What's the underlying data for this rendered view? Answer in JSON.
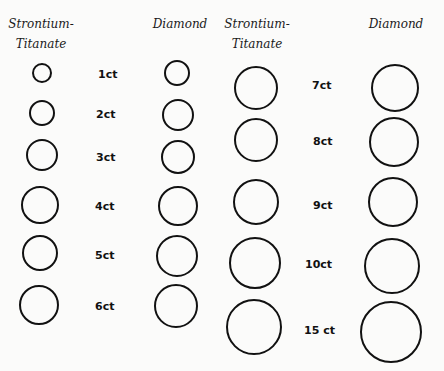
{
  "headers": {
    "left_st": "Strontium-Titanate",
    "left_st_line1": "Strontium-",
    "left_st_line2": "Titanate",
    "left_dia": "Diamond",
    "right_st_line1": "Strontium-",
    "right_st_line2": "Titanate",
    "right_dia": "Diamond"
  },
  "rows": [
    {
      "label": "1ct",
      "st": {
        "cx": 42,
        "cy": 73,
        "r": 10
      },
      "dia": {
        "cx": 177,
        "cy": 73,
        "r": 13
      },
      "lx": 98,
      "ly": 74
    },
    {
      "label": "2ct",
      "st": {
        "cx": 42,
        "cy": 113,
        "r": 13
      },
      "dia": {
        "cx": 178,
        "cy": 115,
        "r": 16
      },
      "lx": 96,
      "ly": 114
    },
    {
      "label": "3ct",
      "st": {
        "cx": 42,
        "cy": 155,
        "r": 16
      },
      "dia": {
        "cx": 178,
        "cy": 157,
        "r": 17
      },
      "lx": 96,
      "ly": 157
    },
    {
      "label": "4ct",
      "st": {
        "cx": 40,
        "cy": 205,
        "r": 19
      },
      "dia": {
        "cx": 178,
        "cy": 206,
        "r": 20
      },
      "lx": 95,
      "ly": 206
    },
    {
      "label": "5ct",
      "st": {
        "cx": 40,
        "cy": 253,
        "r": 18
      },
      "dia": {
        "cx": 177,
        "cy": 256,
        "r": 21
      },
      "lx": 95,
      "ly": 255
    },
    {
      "label": "6ct",
      "st": {
        "cx": 39,
        "cy": 305,
        "r": 20
      },
      "dia": {
        "cx": 176,
        "cy": 306,
        "r": 22
      },
      "lx": 95,
      "ly": 306
    },
    {
      "label": "7ct",
      "st": {
        "cx": 256,
        "cy": 88,
        "r": 22
      },
      "dia": {
        "cx": 395,
        "cy": 88,
        "r": 24
      },
      "lx": 312,
      "ly": 85
    },
    {
      "label": "8ct",
      "st": {
        "cx": 256,
        "cy": 140,
        "r": 22
      },
      "dia": {
        "cx": 394,
        "cy": 142,
        "r": 25
      },
      "lx": 313,
      "ly": 141
    },
    {
      "label": "9ct",
      "st": {
        "cx": 256,
        "cy": 202,
        "r": 23
      },
      "dia": {
        "cx": 393,
        "cy": 202,
        "r": 25
      },
      "lx": 313,
      "ly": 205
    },
    {
      "label": "10ct",
      "st": {
        "cx": 255,
        "cy": 263,
        "r": 26
      },
      "dia": {
        "cx": 392,
        "cy": 266,
        "r": 28
      },
      "lx": 305,
      "ly": 264
    },
    {
      "label": "15 ct",
      "st": {
        "cx": 254,
        "cy": 327,
        "r": 28
      },
      "dia": {
        "cx": 391,
        "cy": 332,
        "r": 31
      },
      "lx": 304,
      "ly": 330
    }
  ]
}
